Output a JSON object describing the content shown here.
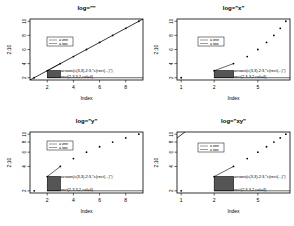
{
  "chart_data": [
    {
      "type": "scatter",
      "title": "log=\"\"",
      "xlabel": "Index",
      "ylabel": "2:10",
      "log": "",
      "x": [
        1,
        2,
        3,
        4,
        5,
        6,
        7,
        8,
        9
      ],
      "y": [
        2,
        3,
        4,
        5,
        6,
        7,
        8,
        9,
        10
      ],
      "xticks": [
        2,
        4,
        6,
        8
      ],
      "yticks": [
        2,
        4,
        6,
        8,
        10
      ],
      "xlim": [
        0.68,
        9.32
      ],
      "ylim": [
        1.68,
        10.32
      ],
      "legend": [
        "a one",
        "a two"
      ],
      "annotations": [
        "arrows(c(3,3),2:3,*c(rect(...)\")",
        "rect(2,3,3,2,col=4)"
      ],
      "grid": false
    },
    {
      "type": "scatter",
      "title": "log=\"x\"",
      "xlabel": "Index",
      "ylabel": "2:10",
      "log": "x",
      "x": [
        1,
        2,
        3,
        4,
        5,
        6,
        7,
        8,
        9
      ],
      "y": [
        2,
        3,
        4,
        5,
        6,
        7,
        8,
        9,
        10
      ],
      "xticks": [
        1,
        2,
        5
      ],
      "yticks": [
        2,
        4,
        6,
        8,
        10
      ],
      "xlim": [
        0.916,
        9.82
      ],
      "ylim": [
        1.68,
        10.32
      ],
      "legend": [
        "a one",
        "a two"
      ],
      "annotations": [
        "arrows(c(3,3),2:3,*c(rect(...)\")",
        "rect(2,3,3,2,col=4)"
      ],
      "grid": false
    },
    {
      "type": "scatter",
      "title": "log=\"y\"",
      "xlabel": "Index",
      "ylabel": "2:10",
      "log": "y",
      "x": [
        1,
        2,
        3,
        4,
        5,
        6,
        7,
        8,
        9
      ],
      "y": [
        2,
        3,
        4,
        5,
        6,
        7,
        8,
        9,
        10
      ],
      "xticks": [
        2,
        4,
        6,
        8
      ],
      "yticks": [
        2,
        4,
        6,
        8,
        10
      ],
      "xlim": [
        0.68,
        9.32
      ],
      "ylim": [
        1.88,
        10.64
      ],
      "legend": [
        "a one",
        "a two"
      ],
      "annotations": [
        "arrows(c(3,3),2:3,*c(rect(...)\")",
        "rect(2,3,3,2,col=4)"
      ],
      "grid": false
    },
    {
      "type": "scatter",
      "title": "log=\"xy\"",
      "xlabel": "Index",
      "ylabel": "2:10",
      "log": "xy",
      "x": [
        1,
        2,
        3,
        4,
        5,
        6,
        7,
        8,
        9
      ],
      "y": [
        2,
        3,
        4,
        5,
        6,
        7,
        8,
        9,
        10
      ],
      "xticks": [
        1,
        2,
        5
      ],
      "yticks": [
        2,
        4,
        6,
        8,
        10
      ],
      "xlim": [
        0.916,
        9.82
      ],
      "ylim": [
        1.88,
        10.64
      ],
      "legend": [
        "a one",
        "a two"
      ],
      "annotations": [
        "arrows(c(3,3),2:3,*c(rect(...)\")",
        "rect(2,3,3,2,col=4)"
      ],
      "grid": false
    }
  ],
  "colors": {
    "rect_fill": "#555555",
    "line": "#000000",
    "axis": "#000000"
  }
}
